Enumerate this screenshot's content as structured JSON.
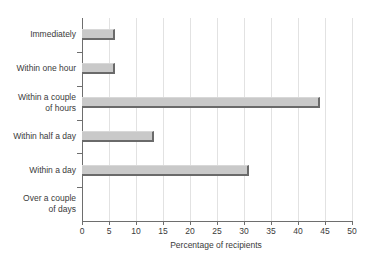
{
  "chart_data": {
    "type": "bar",
    "orientation": "horizontal",
    "title": "",
    "xlabel": "Percentage of recipients",
    "ylabel": "",
    "xlim": [
      0,
      50
    ],
    "xticks": [
      0,
      5,
      10,
      15,
      20,
      25,
      30,
      35,
      40,
      45,
      50
    ],
    "grid": true,
    "legend": null,
    "categories": [
      "Immediately",
      "Within one hour",
      "Within a couple\nof hours",
      "Within half a day",
      "Within a day",
      "Over a couple\nof days"
    ],
    "values": [
      6.2,
      6.2,
      44,
      13.3,
      31,
      0
    ],
    "bar_color": "#c9c9c9",
    "bar_edge_color": "#6a6a6a",
    "axis_color": "#6e6e6e",
    "grid_color": "#e2e2e2",
    "background_color": "#ffffff",
    "text_color": "#3a3a3a"
  }
}
